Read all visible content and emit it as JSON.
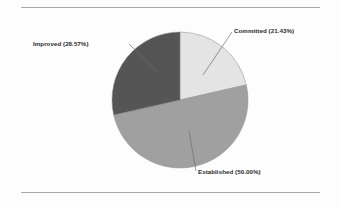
{
  "figure": {
    "background_color": "#fdfdfd",
    "rule_color": "#a8a8a8",
    "label_color": "#2b2b2b"
  },
  "chart_data": {
    "type": "pie",
    "title": "",
    "subtitle": "",
    "xlabel": "",
    "ylabel": "",
    "legend_position": "none",
    "grid": false,
    "labels_position": "outside-with-leader-lines",
    "start_angle_deg": 0,
    "direction": "clockwise",
    "center": {
      "x": 180,
      "y": 100
    },
    "radius": 68,
    "categories": [
      "Committed",
      "Established",
      "Improved"
    ],
    "values": [
      21.43,
      50.0,
      28.57
    ],
    "value_unit": "%",
    "slices": [
      {
        "name": "Committed",
        "label": "Committed (21.43%)",
        "percent": 21.43,
        "color": "#e4e4e4",
        "start_angle_deg": 0,
        "end_angle_deg": 77.15,
        "leader": {
          "x1": 203,
          "y1": 75,
          "x2": 232,
          "y2": 32
        }
      },
      {
        "name": "Established",
        "label": "Established (50.00%)",
        "percent": 50.0,
        "color": "#a0a0a0",
        "start_angle_deg": 77.15,
        "end_angle_deg": 257.15,
        "leader": {
          "x1": 189,
          "y1": 131,
          "x2": 196,
          "y2": 171
        }
      },
      {
        "name": "Improved",
        "label": "Improved (28.57%)",
        "percent": 28.57,
        "color": "#555555",
        "start_angle_deg": 257.15,
        "end_angle_deg": 360,
        "leader": {
          "x1": 158,
          "y1": 72,
          "x2": 129,
          "y2": 44
        }
      }
    ]
  }
}
